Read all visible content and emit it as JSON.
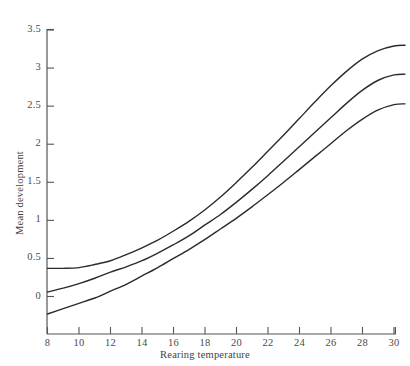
{
  "chart_data": {
    "type": "line",
    "title": "",
    "xlabel": "Rearing temperature",
    "ylabel": "Mean development",
    "xlim": [
      8,
      30.7
    ],
    "ylim": [
      -0.3,
      3.5
    ],
    "grid": false,
    "legend": null,
    "xticks": [
      8,
      10,
      12,
      14,
      16,
      18,
      20,
      22,
      24,
      26,
      28,
      30
    ],
    "xtick_labels": [
      "8",
      "10",
      "12",
      "14",
      "16",
      "18",
      "20",
      "22",
      "24",
      "26",
      "28",
      "30"
    ],
    "yticks": [
      0,
      0.5,
      1,
      1.5,
      2,
      2.5,
      3,
      3.5
    ],
    "ytick_labels": [
      "0",
      "0.5",
      "1",
      "1.5",
      "2",
      "2.5",
      "3",
      "3.5"
    ],
    "line_color": "#2b2b2b",
    "line_width": 1.4,
    "x": [
      8,
      9,
      10,
      11,
      12,
      13,
      14,
      15,
      16,
      17,
      18,
      19,
      20,
      21,
      22,
      23,
      24,
      25,
      26,
      27,
      28,
      29,
      30,
      30.7
    ],
    "series": [
      {
        "name": "upper",
        "values": [
          0.37,
          0.37,
          0.38,
          0.42,
          0.47,
          0.55,
          0.64,
          0.74,
          0.86,
          0.99,
          1.14,
          1.31,
          1.5,
          1.7,
          1.91,
          2.12,
          2.34,
          2.56,
          2.77,
          2.96,
          3.12,
          3.23,
          3.29,
          3.3
        ]
      },
      {
        "name": "middle",
        "values": [
          0.06,
          0.11,
          0.17,
          0.24,
          0.32,
          0.39,
          0.47,
          0.57,
          0.68,
          0.8,
          0.94,
          1.08,
          1.24,
          1.41,
          1.59,
          1.78,
          1.97,
          2.16,
          2.35,
          2.54,
          2.71,
          2.84,
          2.91,
          2.92
        ]
      },
      {
        "name": "lower",
        "values": [
          -0.23,
          -0.16,
          -0.09,
          -0.02,
          0.07,
          0.16,
          0.27,
          0.38,
          0.5,
          0.62,
          0.75,
          0.89,
          1.03,
          1.18,
          1.34,
          1.5,
          1.67,
          1.84,
          2.01,
          2.18,
          2.33,
          2.45,
          2.52,
          2.53
        ]
      }
    ]
  },
  "figure": {
    "background_color": "#ffffff"
  }
}
